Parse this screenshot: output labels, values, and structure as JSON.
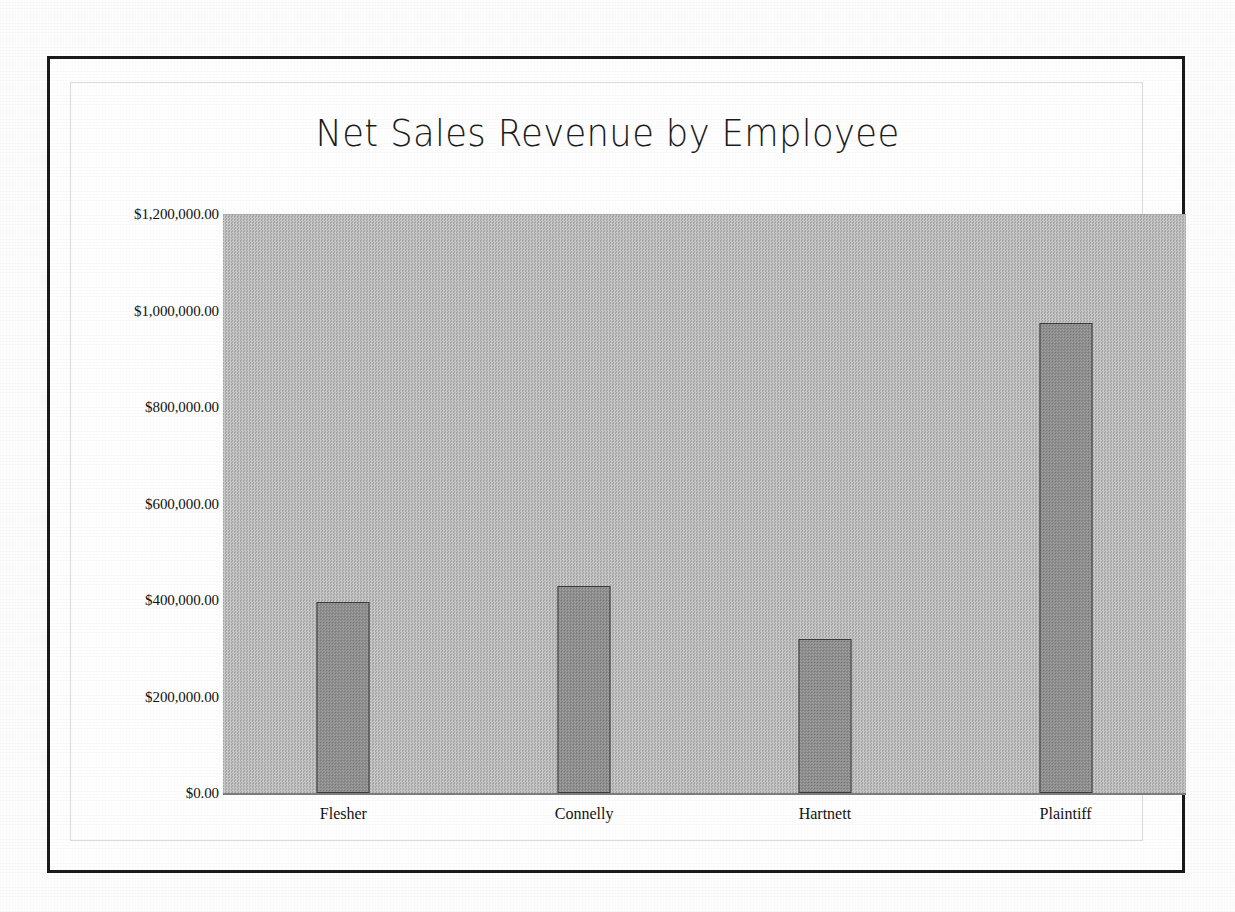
{
  "chart_data": {
    "type": "bar",
    "title": "Net Sales Revenue by Employee",
    "xlabel": "",
    "ylabel": "",
    "categories": [
      "Flesher",
      "Connelly",
      "Hartnett",
      "Plaintiff"
    ],
    "values": [
      395000,
      430000,
      320000,
      975000
    ],
    "ylim": [
      0,
      1200000
    ],
    "ytick_values": [
      0,
      200000,
      400000,
      600000,
      800000,
      1000000,
      1200000
    ],
    "ytick_labels": [
      "$0.00",
      "$200,000.00",
      "$400,000.00",
      "$600,000.00",
      "$800,000.00",
      "$1,000,000.00",
      "$1,200,000.00"
    ],
    "grid": false,
    "legend": "none",
    "series": [
      {
        "name": "Net Sales Revenue",
        "values": [
          395000,
          430000,
          320000,
          975000
        ]
      }
    ],
    "colors": {
      "bar_fill": "#8e8e8e",
      "bar_outline": "#3a3a3a",
      "plot_background": "#b9b9b9",
      "page_background": "#ffffff",
      "frame": "#1a1a1a",
      "text": "#131313"
    }
  }
}
